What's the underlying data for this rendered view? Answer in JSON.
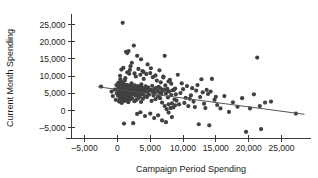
{
  "chart_data": {
    "type": "scatter",
    "title": "",
    "xlabel": "Campaign Period Spending",
    "ylabel": "Current Month Spending",
    "xlim": [
      -7000,
      29500
    ],
    "ylim": [
      -8000,
      27500
    ],
    "grid": false,
    "legend": null,
    "xticks": [
      -5000,
      0,
      5000,
      10000,
      15000,
      20000,
      25000
    ],
    "xtick_labels": [
      "–5,000",
      "0",
      "5,000",
      "10,000",
      "15,000",
      "20,000",
      "25,000"
    ],
    "yticks": [
      -5000,
      0,
      5000,
      10000,
      15000,
      20000,
      25000
    ],
    "ytick_labels": [
      "–5,000",
      "0",
      "5,000",
      "10,000",
      "15,000",
      "20,000",
      "25,000"
    ],
    "point_color": "#414141",
    "point_radius": 2.1,
    "trend": {
      "name": "linear fit",
      "color": "#555555",
      "x0": -3000,
      "y0": 6900,
      "x1": 28500,
      "y1": -1100
    },
    "series": [
      {
        "name": "Donors",
        "points": [
          [
            -2500,
            6950
          ],
          [
            -900,
            5500
          ],
          [
            -700,
            4200
          ],
          [
            -400,
            6100
          ],
          [
            -250,
            3100
          ],
          [
            -150,
            7400
          ],
          [
            -100,
            5000
          ],
          [
            0,
            6200
          ],
          [
            100,
            4300
          ],
          [
            150,
            8100
          ],
          [
            200,
            5600
          ],
          [
            250,
            2600
          ],
          [
            300,
            6800
          ],
          [
            320,
            4900
          ],
          [
            350,
            7200
          ],
          [
            380,
            3500
          ],
          [
            400,
            5800
          ],
          [
            430,
            6400
          ],
          [
            450,
            9100
          ],
          [
            470,
            4100
          ],
          [
            500,
            5200
          ],
          [
            520,
            7000
          ],
          [
            540,
            3000
          ],
          [
            560,
            6600
          ],
          [
            580,
            5400
          ],
          [
            600,
            4600
          ],
          [
            620,
            8300
          ],
          [
            640,
            6000
          ],
          [
            660,
            2200
          ],
          [
            680,
            5700
          ],
          [
            700,
            7600
          ],
          [
            720,
            4400
          ],
          [
            740,
            6300
          ],
          [
            760,
            3700
          ],
          [
            780,
            5100
          ],
          [
            800,
            25500
          ],
          [
            820,
            6700
          ],
          [
            840,
            4800
          ],
          [
            860,
            5900
          ],
          [
            880,
            7800
          ],
          [
            900,
            3300
          ],
          [
            920,
            6100
          ],
          [
            940,
            5300
          ],
          [
            960,
            4000
          ],
          [
            980,
            6900
          ],
          [
            1000,
            5500
          ],
          [
            1020,
            2800
          ],
          [
            1040,
            7300
          ],
          [
            1060,
            4500
          ],
          [
            1080,
            6200
          ],
          [
            1100,
            5000
          ],
          [
            1120,
            8700
          ],
          [
            1140,
            3900
          ],
          [
            1160,
            6500
          ],
          [
            1180,
            5600
          ],
          [
            1200,
            4200
          ],
          [
            1220,
            7100
          ],
          [
            1240,
            5800
          ],
          [
            1260,
            3400
          ],
          [
            1280,
            6000
          ],
          [
            1300,
            17100
          ],
          [
            1320,
            5200
          ],
          [
            1340,
            4700
          ],
          [
            1360,
            6800
          ],
          [
            1380,
            5400
          ],
          [
            1400,
            2900
          ],
          [
            1420,
            7500
          ],
          [
            1440,
            6100
          ],
          [
            1460,
            4300
          ],
          [
            1480,
            5700
          ],
          [
            1500,
            16700
          ],
          [
            1520,
            6400
          ],
          [
            1540,
            3600
          ],
          [
            1560,
            5900
          ],
          [
            1580,
            7000
          ],
          [
            1600,
            4900
          ],
          [
            1620,
            6300
          ],
          [
            1640,
            5100
          ],
          [
            1660,
            2400
          ],
          [
            1680,
            6600
          ],
          [
            1700,
            17300
          ],
          [
            1720,
            5500
          ],
          [
            1740,
            4400
          ],
          [
            1760,
            7200
          ],
          [
            1780,
            6000
          ],
          [
            1800,
            3800
          ],
          [
            1820,
            5300
          ],
          [
            1840,
            6700
          ],
          [
            1860,
            4600
          ],
          [
            1880,
            5800
          ],
          [
            1900,
            11800
          ],
          [
            1920,
            6200
          ],
          [
            1940,
            3200
          ],
          [
            1960,
            7400
          ],
          [
            1980,
            5000
          ],
          [
            2000,
            6500
          ],
          [
            2050,
            4100
          ],
          [
            2100,
            5600
          ],
          [
            2150,
            7900
          ],
          [
            2200,
            6300
          ],
          [
            2250,
            3500
          ],
          [
            2300,
            5200
          ],
          [
            2350,
            6900
          ],
          [
            2400,
            4800
          ],
          [
            2450,
            5900
          ],
          [
            2500,
            18900
          ],
          [
            2550,
            6100
          ],
          [
            2600,
            2700
          ],
          [
            2650,
            7300
          ],
          [
            2700,
            5400
          ],
          [
            2750,
            4300
          ],
          [
            2800,
            6600
          ],
          [
            2850,
            5700
          ],
          [
            2900,
            3100
          ],
          [
            2950,
            6000
          ],
          [
            3000,
            15900
          ],
          [
            3050,
            5100
          ],
          [
            3100,
            4500
          ],
          [
            3150,
            7100
          ],
          [
            3200,
            6400
          ],
          [
            3250,
            3700
          ],
          [
            3300,
            5800
          ],
          [
            3350,
            6200
          ],
          [
            3400,
            4000
          ],
          [
            3450,
            5300
          ],
          [
            3500,
            10400
          ],
          [
            3550,
            6800
          ],
          [
            3600,
            2500
          ],
          [
            3650,
            7600
          ],
          [
            3700,
            5500
          ],
          [
            3750,
            4700
          ],
          [
            3800,
            6100
          ],
          [
            3850,
            5000
          ],
          [
            3900,
            3400
          ],
          [
            3950,
            6500
          ],
          [
            4000,
            11200
          ],
          [
            4100,
            5600
          ],
          [
            4200,
            4200
          ],
          [
            4300,
            7000
          ],
          [
            4400,
            6300
          ],
          [
            4500,
            3900
          ],
          [
            4600,
            5200
          ],
          [
            4700,
            6700
          ],
          [
            4800,
            4600
          ],
          [
            4900,
            5900
          ],
          [
            5000,
            10900
          ],
          [
            5100,
            6000
          ],
          [
            5200,
            2800
          ],
          [
            5300,
            7200
          ],
          [
            5400,
            5400
          ],
          [
            5500,
            4400
          ],
          [
            5600,
            6200
          ],
          [
            5700,
            5100
          ],
          [
            5800,
            3300
          ],
          [
            5900,
            6600
          ],
          [
            6000,
            8700
          ],
          [
            6100,
            5700
          ],
          [
            6200,
            4100
          ],
          [
            6300,
            6900
          ],
          [
            6400,
            5300
          ],
          [
            6500,
            3600
          ],
          [
            6600,
            6400
          ],
          [
            6700,
            4900
          ],
          [
            6800,
            2300
          ],
          [
            6900,
            5800
          ],
          [
            7000,
            9600
          ],
          [
            7100,
            6100
          ],
          [
            7200,
            1300
          ],
          [
            7300,
            7300
          ],
          [
            7400,
            5000
          ],
          [
            7500,
            400
          ],
          [
            7600,
            6300
          ],
          [
            7700,
            3800
          ],
          [
            7800,
            1800
          ],
          [
            7900,
            5500
          ],
          [
            8000,
            8900
          ],
          [
            8100,
            700
          ],
          [
            8200,
            4500
          ],
          [
            8300,
            2100
          ],
          [
            8400,
            5900
          ],
          [
            8500,
            900
          ],
          [
            8600,
            6000
          ],
          [
            8700,
            3200
          ],
          [
            8800,
            1500
          ],
          [
            8900,
            4700
          ],
          [
            1000,
            -3800
          ],
          [
            2400,
            -3700
          ],
          [
            3000,
            -1000
          ],
          [
            3500,
            -500
          ],
          [
            4200,
            -1600
          ],
          [
            5000,
            -900
          ],
          [
            5600,
            -2200
          ],
          [
            6200,
            -1400
          ],
          [
            6800,
            -2900
          ],
          [
            7400,
            -3400
          ],
          [
            7800,
            -600
          ],
          [
            8300,
            -1900
          ],
          [
            600,
            11900
          ],
          [
            900,
            12400
          ],
          [
            1500,
            11100
          ],
          [
            2000,
            12900
          ],
          [
            2600,
            10800
          ],
          [
            3200,
            12100
          ],
          [
            3800,
            11500
          ],
          [
            4400,
            10600
          ],
          [
            5100,
            12300
          ],
          [
            5800,
            10200
          ],
          [
            6400,
            11700
          ],
          [
            7000,
            9900
          ],
          [
            7600,
            5900
          ],
          [
            8200,
            7800
          ],
          [
            8800,
            6400
          ],
          [
            9200,
            10400
          ],
          [
            9600,
            5100
          ],
          [
            10000,
            6200
          ],
          [
            10400,
            3700
          ],
          [
            10800,
            1300
          ],
          [
            11200,
            4400
          ],
          [
            11600,
            2600
          ],
          [
            12000,
            5800
          ],
          [
            12400,
            -4000
          ],
          [
            12800,
            9100
          ],
          [
            13200,
            2000
          ],
          [
            13600,
            6000
          ],
          [
            14000,
            -4300
          ],
          [
            14400,
            9200
          ],
          [
            14800,
            3100
          ],
          [
            15200,
            1600
          ],
          [
            15700,
            600
          ],
          [
            16300,
            4200
          ],
          [
            17000,
            -400
          ],
          [
            17600,
            2400
          ],
          [
            18300,
            1100
          ],
          [
            19000,
            3600
          ],
          [
            19600,
            -6200
          ],
          [
            20200,
            600
          ],
          [
            20800,
            4700
          ],
          [
            21300,
            15400
          ],
          [
            21700,
            1300
          ],
          [
            21900,
            -5400
          ],
          [
            22500,
            2300
          ],
          [
            23400,
            2600
          ],
          [
            27200,
            -900
          ],
          [
            9800,
            7900
          ],
          [
            10600,
            7100
          ],
          [
            11400,
            6500
          ],
          [
            12200,
            7400
          ],
          [
            13000,
            5300
          ],
          [
            13800,
            4800
          ],
          [
            9000,
            2900
          ],
          [
            9400,
            1800
          ],
          [
            10200,
            2200
          ],
          [
            11000,
            3400
          ],
          [
            11800,
            1000
          ],
          [
            12600,
            3900
          ],
          [
            13400,
            700
          ],
          [
            14200,
            5500
          ],
          [
            15000,
            4000
          ],
          [
            4600,
            13400
          ],
          [
            2200,
            13900
          ],
          [
            7200,
            15900
          ],
          [
            3600,
            14900
          ],
          [
            1200,
            9400
          ],
          [
            2800,
            9900
          ],
          [
            4000,
            9200
          ],
          [
            5400,
            9700
          ],
          [
            6600,
            8200
          ],
          [
            7800,
            8500
          ],
          [
            400,
            10100
          ],
          [
            1800,
            10700
          ]
        ]
      }
    ]
  }
}
